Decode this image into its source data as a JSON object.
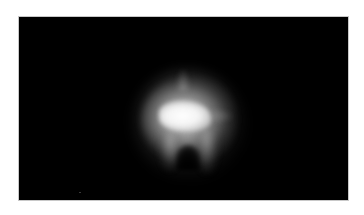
{
  "image": {
    "description": "Blurry white glowing blob on black background",
    "background_color": "#000000",
    "page_color": "#ffffff",
    "frame_border_color": "#c8c8c8",
    "subject": {
      "name": "glowing-blob",
      "core_color": "#ffffff",
      "halo_color": "#b4b4b4"
    }
  }
}
